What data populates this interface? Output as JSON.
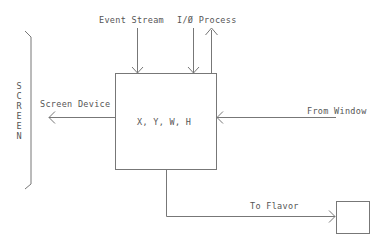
{
  "diagram": {
    "type": "block-flow",
    "central_box": {
      "label": "X, Y, W, H"
    },
    "side_bracket": {
      "label": "SCREEN",
      "letters": "S\nC\nR\nE\nE\nN"
    },
    "inputs": [
      {
        "id": "event-stream",
        "label": "Event Stream",
        "direction": "down-into-box"
      },
      {
        "id": "io-process",
        "label": "I/Ø Process",
        "direction": "bidirectional (down in, up out)"
      },
      {
        "id": "from-window",
        "label": "From Window",
        "direction": "left-into-box"
      }
    ],
    "outputs": [
      {
        "id": "screen-device",
        "label": "Screen Device",
        "direction": "left-out-of-box"
      },
      {
        "id": "to-flavor",
        "label": "To Flavor",
        "direction": "down-then-right-to-small-box"
      }
    ],
    "target_box": {
      "label": ""
    },
    "colors": {
      "line": "#777777",
      "text": "#555555",
      "background": "#ffffff"
    }
  }
}
